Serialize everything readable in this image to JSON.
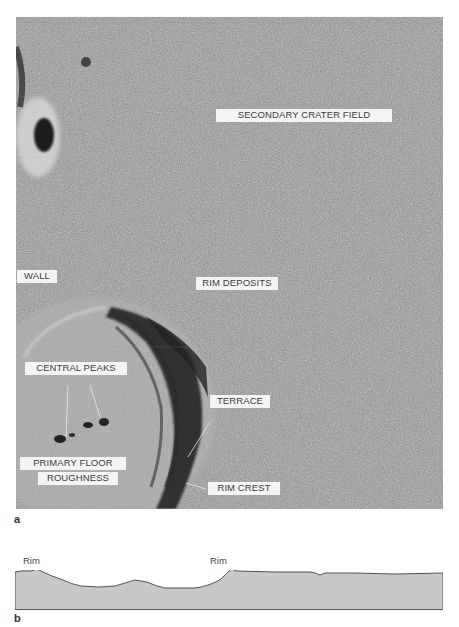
{
  "figure": {
    "panel_a": {
      "letter": "a",
      "image_description": "Aerial/orbital grayscale photograph of a lunar impact crater with labeled features",
      "labels": [
        {
          "id": "secondary-crater-field",
          "text": "SECONDARY CRATER FIELD"
        },
        {
          "id": "wall",
          "text": "WALL"
        },
        {
          "id": "rim-deposits",
          "text": "RIM DEPOSITS"
        },
        {
          "id": "central-peaks",
          "text": "CENTRAL PEAKS"
        },
        {
          "id": "terrace",
          "text": "TERRACE"
        },
        {
          "id": "primary-floor",
          "text": "PRIMARY FLOOR"
        },
        {
          "id": "roughness",
          "text": "ROUGHNESS"
        },
        {
          "id": "rim-crest",
          "text": "RIM CREST"
        }
      ]
    },
    "panel_b": {
      "letter": "b",
      "image_description": "Topographic cross-section profile of the crater",
      "rim_labels": [
        "Rim",
        "Rim"
      ],
      "fill_color": "#c8c8c8",
      "line_color": "#444444"
    }
  }
}
